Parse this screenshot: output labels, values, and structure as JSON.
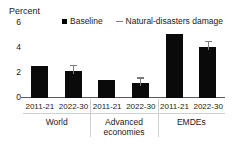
{
  "figure": {
    "top_fragment": "",
    "axis_title": "Percent"
  },
  "legend": {
    "position": "top",
    "items": [
      {
        "label": "Baseline",
        "marker": "filled-square",
        "color": "#0a0a0a"
      },
      {
        "label": "Natural-disasters damage",
        "marker": "dash",
        "color": "#7b7b7b"
      }
    ]
  },
  "chart_data": {
    "type": "bar",
    "title": "",
    "subtitle": "",
    "xlabel": "",
    "ylabel": "Percent",
    "ylim": [
      0,
      6
    ],
    "yticks": [
      0,
      2,
      4,
      6
    ],
    "ytick_labels": [
      "0",
      "2",
      "4",
      "6"
    ],
    "grid": false,
    "legend_position": "top",
    "groups": [
      "World",
      "Advanced economies",
      "EMDEs"
    ],
    "categories": [
      "2011-21",
      "2022-30",
      "2011-21",
      "2022-30",
      "2011-21",
      "2022-30"
    ],
    "series": [
      {
        "name": "Baseline",
        "color": "#0a0a0a",
        "values": [
          2.5,
          2.1,
          1.35,
          1.15,
          4.9,
          3.9
        ]
      },
      {
        "name": "Natural-disasters damage",
        "color": "#7b7b7b",
        "note": "marker drawn as vertical whisker with cap above the 2022-30 bars",
        "values": [
          null,
          2.45,
          null,
          1.5,
          null,
          4.3
        ]
      }
    ],
    "bars": [
      {
        "group": "World",
        "category": "2011-21",
        "baseline": 2.5,
        "damage_marker": null
      },
      {
        "group": "World",
        "category": "2022-30",
        "baseline": 2.1,
        "damage_marker": 2.45
      },
      {
        "group": "Advanced economies",
        "category": "2011-21",
        "baseline": 1.35,
        "damage_marker": null
      },
      {
        "group": "Advanced economies",
        "category": "2022-30",
        "baseline": 1.15,
        "damage_marker": 1.5
      },
      {
        "group": "EMDEs",
        "category": "2011-21",
        "baseline": 4.9,
        "damage_marker": null
      },
      {
        "group": "EMDEs",
        "category": "2022-30",
        "baseline": 3.9,
        "damage_marker": 4.3
      }
    ]
  },
  "colors": {
    "bar": "#0a0a0a",
    "marker": "#7b7b7b",
    "axis": "#5a5a5a",
    "separator": "#cfcfcf",
    "background": "#ffffff",
    "text": "#1a1a1a"
  }
}
